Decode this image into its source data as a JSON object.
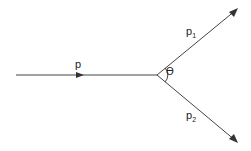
{
  "diagram": {
    "type": "particle decay / momentum diagram",
    "labels": {
      "incoming": "p",
      "outgoing1_base": "p",
      "outgoing1_sub": "1",
      "outgoing2_base": "p",
      "outgoing2_sub": "2",
      "angle": "ϴ"
    },
    "colors": {
      "line": "#444444",
      "background": "#ffffff"
    }
  }
}
